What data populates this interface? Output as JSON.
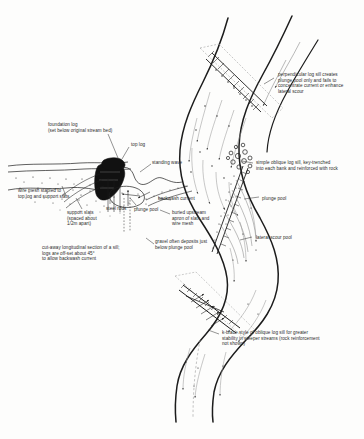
{
  "figure": {
    "background_color": "#fdfdfc",
    "ink_color": "#1c1c1c",
    "text_color": "#2b2b2b",
    "width": 364,
    "height": 439
  },
  "plan_view": {
    "name": "stream plan view",
    "description": "Meandering stream channel running top to bottom with three log sill structures",
    "annotations": [
      {
        "id": "perpendicular-sill",
        "text": "perpendicular log sill creates\nplunge pool only and fails to\nconcentrate current or enhance\nlateral scour",
        "x": 278,
        "y": 72
      },
      {
        "id": "oblique-sill",
        "text": "simple oblique log sill, key-trenched\ninto each bank and reinforced with rock",
        "x": 256,
        "y": 160
      },
      {
        "id": "plunge-pool-right",
        "text": "plunge pool",
        "x": 262,
        "y": 196
      },
      {
        "id": "lateral-scour-pool",
        "text": "lateral scour pool",
        "x": 256,
        "y": 235
      },
      {
        "id": "k-brace-sill",
        "text": "k-brace style of oblique log sill for greater\nstability in steeper streams (rock reinforcement\nnot shown)",
        "x": 222,
        "y": 330
      }
    ]
  },
  "section_view": {
    "name": "cut-away longitudinal section",
    "caption": "cut-away longitudinal section of a sill;\nlogs are off-set about 45°\nto allow backwash current",
    "caption_x": 42,
    "caption_y": 245,
    "annotations": [
      {
        "id": "foundation-log",
        "text": "foundation log\n(set below original stream bed)",
        "x": 48,
        "y": 122
      },
      {
        "id": "top-log",
        "text": "top log",
        "x": 131,
        "y": 142
      },
      {
        "id": "standing-wave",
        "text": "standing wave",
        "x": 152,
        "y": 160
      },
      {
        "id": "wire-mesh",
        "text": "wire mesh stapled to\ntop log and support slats",
        "x": 18,
        "y": 188
      },
      {
        "id": "support-slats",
        "text": "support slats\n(spaced about\n1/2m apart)",
        "x": 67,
        "y": 210
      },
      {
        "id": "steel-rods",
        "text": "steel rods",
        "x": 106,
        "y": 206
      },
      {
        "id": "plunge-pool-left",
        "text": "plunge pool",
        "x": 134,
        "y": 207
      },
      {
        "id": "backwash-current",
        "text": "backwash current",
        "x": 158,
        "y": 196
      },
      {
        "id": "buried-apron",
        "text": "buried upstream\napron of slats and\nwire mesh",
        "x": 172,
        "y": 210
      },
      {
        "id": "gravel-deposit",
        "text": "gravel often deposits just\nbelow plunge pool",
        "x": 155,
        "y": 239
      }
    ]
  }
}
